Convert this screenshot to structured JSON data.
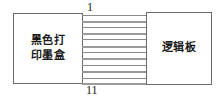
{
  "diagram": {
    "type": "block-diagram",
    "title": "",
    "background_color": "#ffffff",
    "line_color": "#6b6b6b",
    "wire_color": "#8a8a8a",
    "blocks": [
      {
        "id": "cartridge",
        "label": "黑色打\n印墨盒",
        "label_lines": [
          "黑色打",
          "印墨盒"
        ],
        "position": "left"
      },
      {
        "id": "logic-board",
        "label": "逻辑板",
        "label_lines": [
          "逻辑板"
        ],
        "position": "right"
      }
    ],
    "connector": {
      "name": "ribbon-cable",
      "wire_count": 11,
      "first_pin_label": "1",
      "last_pin_label": "11"
    }
  }
}
